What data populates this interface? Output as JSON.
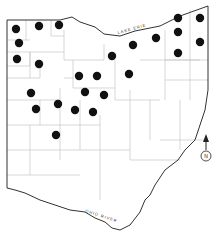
{
  "map": {
    "region": "Ohio",
    "labels": {
      "lake": "LAKE ERIE",
      "river": "OHIO RIVER",
      "north_badge": "N"
    },
    "colors": {
      "dot": "#111111",
      "border": "#333333",
      "county_line": "#bdbdbd"
    },
    "dots": [
      {
        "x": 16,
        "y": 29
      },
      {
        "x": 39,
        "y": 26
      },
      {
        "x": 59,
        "y": 25
      },
      {
        "x": 19,
        "y": 43
      },
      {
        "x": 17,
        "y": 59
      },
      {
        "x": 39,
        "y": 64
      },
      {
        "x": 79,
        "y": 76
      },
      {
        "x": 97,
        "y": 76
      },
      {
        "x": 112,
        "y": 56
      },
      {
        "x": 31,
        "y": 93
      },
      {
        "x": 85,
        "y": 92
      },
      {
        "x": 104,
        "y": 95
      },
      {
        "x": 36,
        "y": 109
      },
      {
        "x": 58,
        "y": 104
      },
      {
        "x": 75,
        "y": 110
      },
      {
        "x": 93,
        "y": 112
      },
      {
        "x": 56,
        "y": 135
      },
      {
        "x": 129,
        "y": 74
      },
      {
        "x": 133,
        "y": 45
      },
      {
        "x": 156,
        "y": 38
      },
      {
        "x": 178,
        "y": 18
      },
      {
        "x": 178,
        "y": 32
      },
      {
        "x": 178,
        "y": 53
      },
      {
        "x": 200,
        "y": 18
      },
      {
        "x": 200,
        "y": 42
      }
    ]
  }
}
